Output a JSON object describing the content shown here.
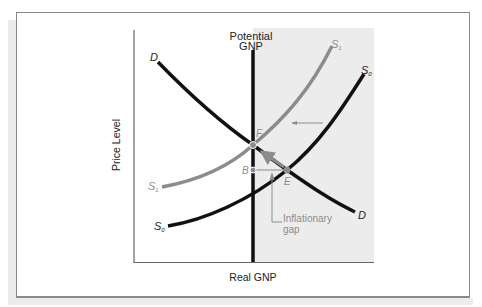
{
  "figure": {
    "type": "aggregate supply and demand diagram",
    "axes": {
      "ylabel": "Price Level",
      "xlabel": "Real GNP"
    },
    "potential_gnp_label_line1": "Potential",
    "potential_gnp_label_line2": "GNP",
    "curves": {
      "demand": {
        "label_start": "D",
        "label_end": "D",
        "color": "#111111"
      },
      "supply_initial": {
        "label": "S",
        "subscript": "0",
        "color": "#111111"
      },
      "supply_new": {
        "label": "S",
        "subscript": "1",
        "color": "#8c8c8c"
      }
    },
    "points": {
      "F": "F",
      "B": "B",
      "E": "E"
    },
    "annotation": {
      "line1": "Inflationary",
      "line2": "gap"
    },
    "colors": {
      "shaded_region": "#ececec",
      "axis": "#666666",
      "frame": "#8a8a8a",
      "grey_curve": "#8c8c8c",
      "black_curve": "#111111"
    }
  }
}
